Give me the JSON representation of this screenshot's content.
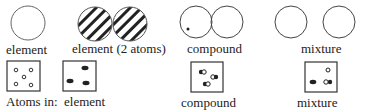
{
  "top_row": {
    "labels": [
      "element",
      "element (2 atoms)",
      "compound",
      "mixture"
    ]
  },
  "bottom_row": {
    "prefix": "Atoms in:",
    "labels": [
      "element",
      "compound",
      "mixture"
    ]
  },
  "colors": {
    "ink": "#222222",
    "line": "#555555"
  }
}
